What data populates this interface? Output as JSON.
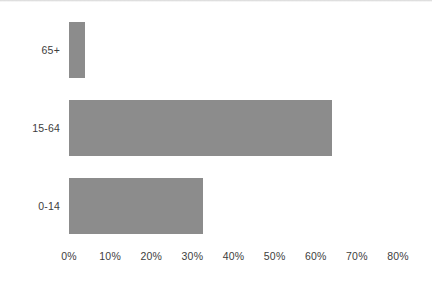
{
  "chart_data": {
    "type": "bar",
    "orientation": "horizontal",
    "title": "",
    "xlabel": "",
    "ylabel": "Age",
    "categories": [
      "0-14",
      "15-64",
      "65+"
    ],
    "values": [
      32.5,
      64.0,
      4.0
    ],
    "value_format": "percent",
    "xlim": [
      0,
      80
    ],
    "xticks": [
      0,
      10,
      20,
      30,
      40,
      50,
      60,
      70,
      80
    ],
    "xticklabels": [
      "0%",
      "10%",
      "20%",
      "30%",
      "40%",
      "50%",
      "60%",
      "70%",
      "80%"
    ],
    "grid": false,
    "legend": false,
    "bar_color": "#8c8c8c",
    "text_color": "#3d3d3d",
    "background": "#ffffff",
    "series": [
      {
        "name": "Population share",
        "points": [
          {
            "category": "65+",
            "value": 4.0
          },
          {
            "category": "15-64",
            "value": 64.0
          },
          {
            "category": "0-14",
            "value": 32.5
          }
        ]
      }
    ]
  },
  "axes": {
    "y_title": "Age",
    "y_labels_top_to_bottom": [
      "65+",
      "15-64",
      "0-14"
    ],
    "x_labels": [
      "0%",
      "10%",
      "20%",
      "30%",
      "40%",
      "50%",
      "60%",
      "70%",
      "80%"
    ]
  },
  "bars_top_to_bottom": [
    {
      "label": "65+",
      "value": 4.0,
      "display": "4%"
    },
    {
      "label": "15-64",
      "value": 64.0,
      "display": "64%"
    },
    {
      "label": "0-14",
      "value": 32.5,
      "display": "32.5%"
    }
  ]
}
